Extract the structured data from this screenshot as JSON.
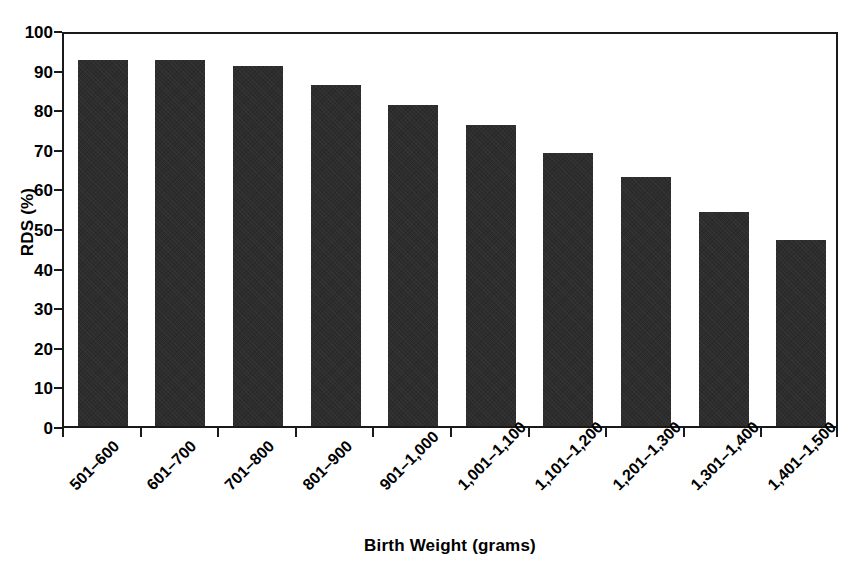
{
  "chart_data": {
    "type": "bar",
    "title": "",
    "xlabel": "Birth Weight (grams)",
    "ylabel": "RDS (%)",
    "ylim": [
      0,
      100
    ],
    "ytick_step": 10,
    "yticks": [
      100,
      90,
      80,
      70,
      60,
      50,
      40,
      30,
      20,
      10,
      0
    ],
    "ytick_labels": [
      "100",
      "90",
      "80",
      "70",
      "60",
      "50",
      "40",
      "30",
      "20",
      "10",
      "0"
    ],
    "grid": false,
    "legend": false,
    "legend_position": "none",
    "bar_color": "#2d2d2d",
    "frame_color": "#1a1a1a",
    "categories": [
      "501–600",
      "601–700",
      "701–800",
      "801–900",
      "901–1,000",
      "1,001–1,100",
      "1,101–1,200",
      "1,201–1,300",
      "1,301–1,400",
      "1,401–1,500"
    ],
    "values": [
      92.5,
      92.5,
      91,
      86,
      81,
      76,
      69,
      63,
      54,
      47
    ],
    "series": [
      {
        "name": "RDS (%)",
        "values": [
          92.5,
          92.5,
          91,
          86,
          81,
          76,
          69,
          63,
          54,
          47
        ]
      }
    ]
  }
}
